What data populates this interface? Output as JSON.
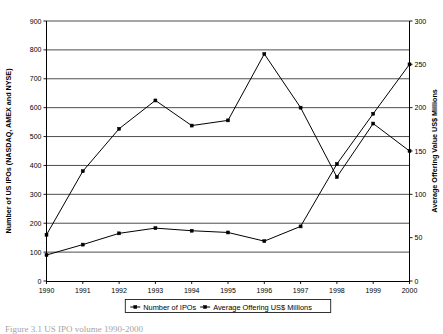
{
  "chart_data": {
    "type": "line",
    "title": "",
    "xlabel": "",
    "categories": [
      "1990",
      "1991",
      "1992",
      "1993",
      "1994",
      "1995",
      "1996",
      "1997",
      "1998",
      "1999",
      "2000"
    ],
    "series": [
      {
        "name": "Number of IPOs",
        "axis": "left",
        "values": [
          160,
          380,
          527,
          625,
          538,
          556,
          786,
          600,
          360,
          545,
          450
        ]
      },
      {
        "name": "Average Offering US$ Millions",
        "axis": "right",
        "values": [
          30,
          42,
          55,
          61,
          58,
          56,
          46,
          63,
          135,
          193,
          250
        ]
      }
    ],
    "left_axis": {
      "label": "Number of US IPOs (NASDAQ, AMEX and NYSE)",
      "ticks": [
        0,
        100,
        200,
        300,
        400,
        500,
        600,
        700,
        800,
        900
      ],
      "min": 0,
      "max": 900
    },
    "right_axis": {
      "label": "Average Offering Value US$ Millions",
      "ticks": [
        0,
        50,
        100,
        150,
        200,
        250,
        300
      ],
      "min": 0,
      "max": 300
    },
    "grid": true,
    "legend_position": "bottom",
    "legend_entries": [
      "Number of IPOs",
      "Average Offering US$ Millions"
    ]
  },
  "caption": {
    "text": "Figure 3.1 US IPO volume 1990-2000"
  }
}
